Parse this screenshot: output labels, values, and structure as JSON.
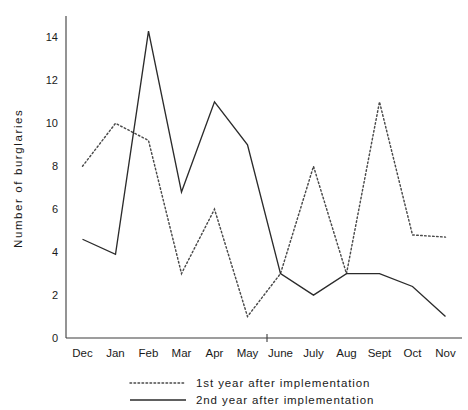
{
  "chart_data": {
    "type": "line",
    "title": "",
    "subtitle": "",
    "xlabel": "",
    "ylabel": "Number  of  burglaries",
    "categories": [
      "Dec",
      "Jan",
      "Feb",
      "Mar",
      "Apr",
      "May",
      "June",
      "July",
      "Aug",
      "Sept",
      "Oct",
      "Nov"
    ],
    "yticks": [
      0,
      2,
      4,
      6,
      8,
      10,
      12,
      14
    ],
    "ylim": [
      0,
      15
    ],
    "grid": false,
    "legend_position": "bottom",
    "series": [
      {
        "name": "1st  year  after  implementation",
        "style": "dotted",
        "color": "#4a4a4a",
        "values": [
          8,
          10,
          9.2,
          3,
          6,
          1,
          3,
          8,
          3,
          11,
          4.8,
          4.7
        ]
      },
      {
        "name": "2nd  year  after  implementation",
        "style": "solid",
        "color": "#2b2b2b",
        "values": [
          4.6,
          3.9,
          14.3,
          6.8,
          11,
          9,
          3,
          2,
          3,
          3,
          2.4,
          1
        ]
      }
    ]
  },
  "axis": {
    "y_title": "Number  of  burglaries"
  },
  "legend": {
    "items": [
      {
        "label": "1st  year  after  implementation",
        "style": "dotted"
      },
      {
        "label": "2nd  year  after  implementation",
        "style": "solid"
      }
    ]
  }
}
